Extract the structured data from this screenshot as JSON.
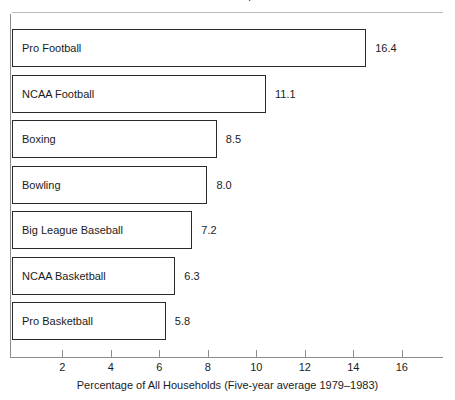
{
  "chart_data": {
    "type": "bar",
    "orientation": "horizontal",
    "title": "",
    "xlabel": "Percentage of All Households (Five-year average 1979–1983)",
    "ylabel": "",
    "categories": [
      "Pro Football",
      "NCAA Football",
      "Boxing",
      "Bowling",
      "Big League Baseball",
      "NCAA Basketball",
      "Pro Basketball"
    ],
    "values": [
      16.4,
      11.1,
      8.5,
      8.0,
      7.2,
      6.3,
      5.8
    ],
    "value_labels": [
      "16.4",
      "11.1",
      "8.5",
      "8.0",
      "7.2",
      "6.3",
      "5.8"
    ],
    "xlim": [
      0,
      17.6
    ],
    "xticks": [
      2,
      4,
      6,
      8,
      10,
      12,
      14,
      16
    ],
    "xtick_labels": [
      "2",
      "4",
      "6",
      "8",
      "10",
      "12",
      "14",
      "16"
    ],
    "grid": false,
    "legend": null,
    "legend_position": "none",
    "bar_fill": "#ffffff",
    "bar_stroke": "#2b2b2b",
    "axis_color": "#8b8b90",
    "text_color": "#1b1b1b"
  },
  "figure": {
    "clipped_title_fragment": ".",
    "x_caption": "Percentage of All Households (Five-year average 1979–1983)"
  },
  "geometry": {
    "bar_zero_px": 56.2,
    "bar_px_per_unit": 18.9,
    "bar_left_px": 12,
    "axis_zero_px": 13.8,
    "axis_px_per_unit": 24.25,
    "first_bar_top_px": 29,
    "bar_pitch_px": 45.5,
    "bar_height_px": 38
  }
}
